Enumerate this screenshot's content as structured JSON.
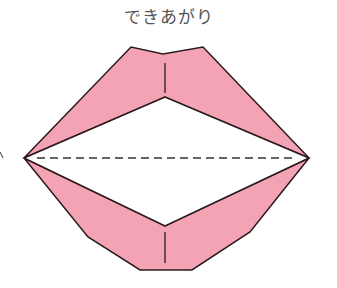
{
  "title": "できあがり",
  "diagram": {
    "colors": {
      "fill": "#f4a3b5",
      "stroke": "#2a1a1e",
      "background": "#ffffff",
      "title": "#555555"
    },
    "elements": [
      "upper-lip",
      "lower-lip",
      "mouth-opening",
      "valley-fold-dashed-line",
      "upper-center-crease",
      "lower-center-crease"
    ]
  }
}
